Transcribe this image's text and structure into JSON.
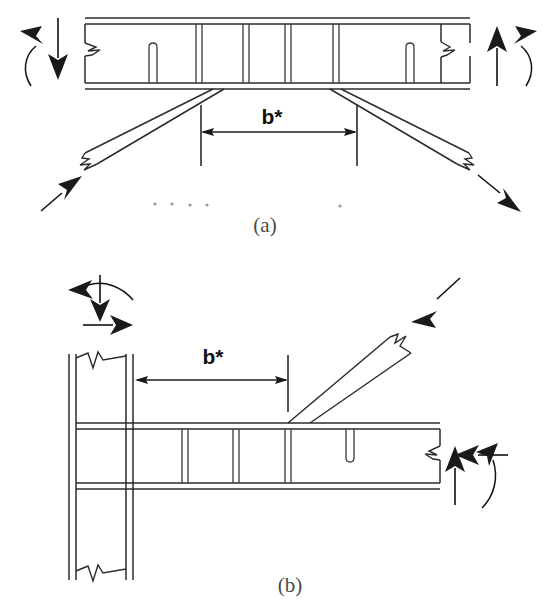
{
  "figure": {
    "background_color": "#ffffff",
    "line_color": "#2b2b2b",
    "width": 553,
    "height": 602
  },
  "panels": [
    {
      "id": "a",
      "caption": "(a)",
      "caption_x": 265,
      "caption_y": 232,
      "description": "Simply supported composite truss beam with diagonal braces at both ends",
      "dimension": {
        "label": "b*",
        "label_x": 272,
        "label_y": 122,
        "line_y": 132,
        "x_start": 201,
        "x_end": 357
      },
      "beam": {
        "x_left": 85,
        "x_right": 470,
        "top_flange_y1": 18,
        "top_flange_y2": 24,
        "bottom_flange_y1": 83,
        "bottom_flange_y2": 89,
        "stiffeners_x": [
          199,
          246,
          288,
          336
        ],
        "studs_x": [
          152,
          410
        ],
        "stud_top_y": 43,
        "break_left_x": 85,
        "break_right_x": 434
      },
      "braces": [
        {
          "name": "left-diagonal-brace",
          "x1": 212,
          "y1": 89,
          "x2": 78,
          "y2": 158
        },
        {
          "name": "right-diagonal-brace",
          "x1": 352,
          "y1": 89,
          "x2": 486,
          "y2": 158
        }
      ],
      "loads": [
        {
          "name": "left-moment-arrow",
          "type": "moment",
          "x": 35,
          "y": 30
        },
        {
          "name": "left-vertical-force-arrow",
          "type": "force-down",
          "x": 58,
          "y": 22
        },
        {
          "name": "right-vertical-force-arrow",
          "type": "force-up",
          "x": 497,
          "y": 88
        },
        {
          "name": "right-moment-arrow",
          "type": "moment",
          "x": 521,
          "y": 30
        },
        {
          "name": "left-brace-force-arrow",
          "type": "force-diagonal-in",
          "x": 60,
          "y": 200
        },
        {
          "name": "right-brace-force-arrow",
          "type": "force-diagonal-out",
          "x": 500,
          "y": 200
        }
      ]
    },
    {
      "id": "b",
      "caption": "(b)",
      "caption_x": 290,
      "caption_y": 592,
      "description": "Beam-to-column joint with inclined brace, cantilever configuration",
      "dimension": {
        "label": "b*",
        "label_x": 218,
        "label_y": 362,
        "line_y": 380,
        "x_start": 135,
        "x_end": 288
      },
      "column": {
        "x_left": 69,
        "x_right": 133,
        "y_top": 354,
        "y_bottom": 580,
        "inner_offset": 7
      },
      "beam": {
        "x_left": 133,
        "x_right": 440,
        "top_flange_y1": 423,
        "top_flange_y2": 429,
        "bottom_flange_y1": 483,
        "bottom_flange_y2": 489,
        "stiffeners_x": [
          185,
          236,
          288
        ],
        "studs_x": [
          350
        ],
        "stud_bottom_y": 462
      },
      "brace": {
        "name": "inclined-brace",
        "x1": 288,
        "y1": 423,
        "x2": 410,
        "y2": 322
      },
      "loads": [
        {
          "name": "column-moment-arrow",
          "type": "moment",
          "x": 90,
          "y": 288
        },
        {
          "name": "column-vertical-force-arrow",
          "type": "force-down",
          "x": 100,
          "y": 280
        },
        {
          "name": "column-horizontal-force-arrow",
          "type": "force-right",
          "x": 90,
          "y": 325
        },
        {
          "name": "brace-force-arrow",
          "type": "force-diagonal-in",
          "x": 440,
          "y": 295
        },
        {
          "name": "beam-end-vertical-arrow",
          "type": "force-up",
          "x": 455,
          "y": 500
        },
        {
          "name": "beam-end-horizontal-arrow",
          "type": "force-left",
          "x": 480,
          "y": 455
        },
        {
          "name": "beam-end-moment-arrow",
          "type": "moment",
          "x": 495,
          "y": 455
        }
      ]
    }
  ],
  "noise_dots": [
    {
      "x": 155,
      "y": 204
    },
    {
      "x": 172,
      "y": 204
    },
    {
      "x": 190,
      "y": 205
    },
    {
      "x": 207,
      "y": 205
    },
    {
      "x": 340,
      "y": 206
    }
  ]
}
